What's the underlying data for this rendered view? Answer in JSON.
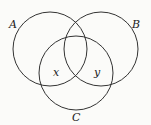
{
  "diagram": {
    "type": "venn",
    "sets": [
      {
        "label": "A",
        "cx": 50,
        "cy": 49,
        "r": 37
      },
      {
        "label": "B",
        "cx": 101,
        "cy": 49,
        "r": 37
      },
      {
        "label": "C",
        "cx": 76,
        "cy": 73,
        "r": 37
      }
    ],
    "regions": [
      {
        "label": "x",
        "position": "A∩C only"
      },
      {
        "label": "y",
        "position": "B∩C only"
      }
    ],
    "stroke_color": "#333333"
  }
}
